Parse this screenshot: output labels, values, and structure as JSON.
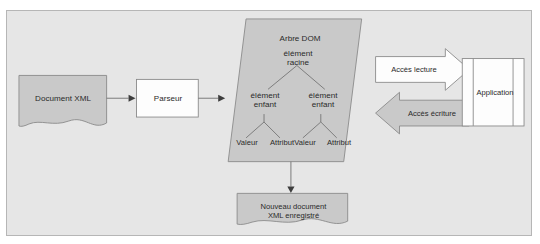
{
  "figure": {
    "background_color": "#e6e6e6",
    "border_color": "#b6b6b6",
    "shape_fill": "#c9c9c9",
    "shape_stroke": "#8a8a8a",
    "white_fill": "#fdfdfd",
    "line_color": "#6f6f6f",
    "text_color": "#2a2a2a"
  },
  "nodes": {
    "source_document": {
      "label": "Document XML",
      "shape": "document-wave"
    },
    "parser": {
      "label": "Parseur",
      "shape": "rectangle"
    },
    "dom_tree": {
      "title": "Arbre DOM",
      "shape": "parallelogram",
      "root": "élément\nracine",
      "children": [
        "élément\nenfant",
        "élément\nenfant"
      ],
      "leaves": [
        "Valeur",
        "Attribut",
        "Valeur",
        "Attribut"
      ]
    },
    "application": {
      "label": "Application",
      "shape": "panelled-rectangle"
    },
    "output_document": {
      "label": "Nouveau document\nXML enregistré",
      "shape": "document-wave"
    }
  },
  "arrows": {
    "read_access": {
      "label": "Accès lecture",
      "direction": "right",
      "style": "block-arrow-white"
    },
    "write_access": {
      "label": "Accès écriture",
      "direction": "left",
      "style": "block-arrow-gray"
    },
    "doc_to_parser": {
      "direction": "right",
      "style": "thin-line"
    },
    "parser_to_tree": {
      "direction": "right",
      "style": "thin-line"
    },
    "tree_to_output": {
      "direction": "down",
      "style": "thin-line"
    }
  }
}
